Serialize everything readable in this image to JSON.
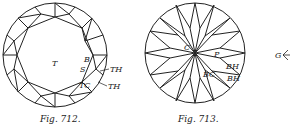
{
  "figures": [
    {
      "caption": "Fig. 712.",
      "labels": {
        "table": "T",
        "bezel": "B",
        "star": "S",
        "top_corner": "TC",
        "top_half_1": "TH",
        "top_half_2": "TH"
      }
    },
    {
      "caption": "Fig. 713.",
      "labels": {
        "culet": "C",
        "pavilion": "P",
        "bottom_corner": "BC",
        "bottom_half_1": "BH",
        "bottom_half_2": "BH"
      }
    }
  ],
  "side_label": "G"
}
